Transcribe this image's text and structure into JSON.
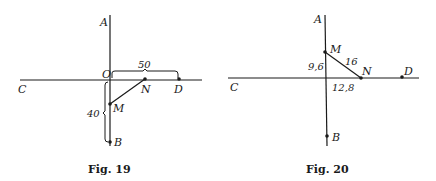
{
  "figures": [
    {
      "caption": "Fig. 19",
      "labels": {
        "A": "A",
        "B": "B",
        "C": "C",
        "D": "D",
        "M": "M",
        "N": "N",
        "O": "O"
      },
      "measures": {
        "OD": "50",
        "OB": "40"
      }
    },
    {
      "caption": "Fig. 20",
      "labels": {
        "A": "A",
        "B": "B",
        "C": "C",
        "D": "D",
        "M": "M",
        "N": "N"
      },
      "measures": {
        "MN": "16",
        "OM": "9,6",
        "ON": "12,8"
      }
    }
  ],
  "colors": {
    "ink": "#1a1a1a",
    "background": "#ffffff"
  }
}
